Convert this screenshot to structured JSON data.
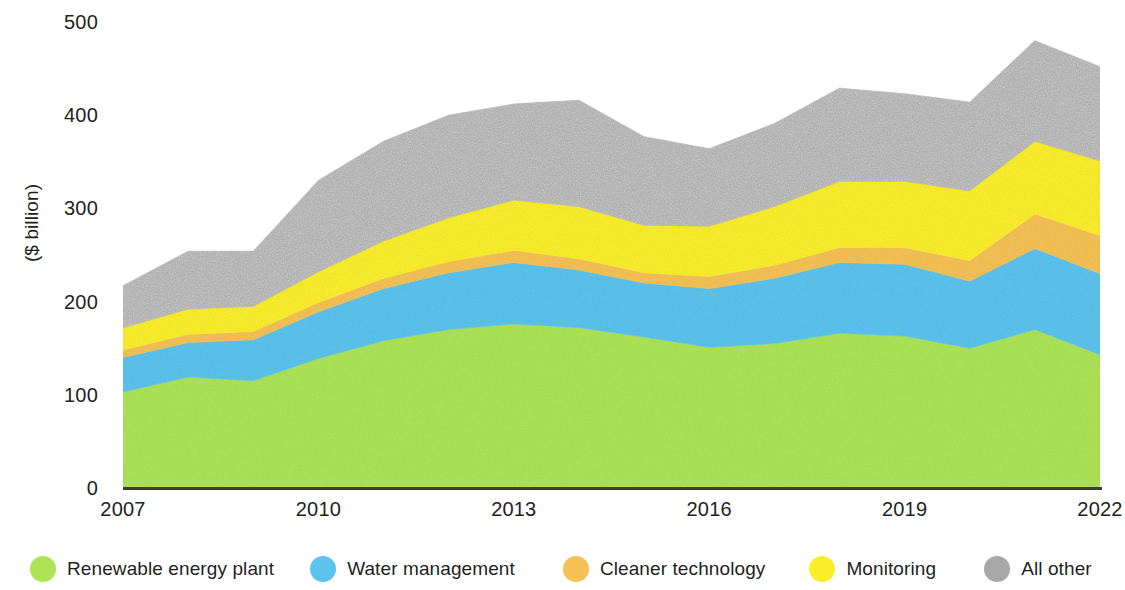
{
  "chart_data": {
    "type": "area",
    "stacked": true,
    "title": "",
    "subtitle": "",
    "xlabel": "",
    "ylabel": "($ billion)",
    "xlim": [
      2007,
      2022
    ],
    "ylim": [
      0,
      500
    ],
    "grid": false,
    "legend_position": "bottom",
    "x": [
      2007,
      2008,
      2009,
      2010,
      2011,
      2012,
      2013,
      2014,
      2015,
      2016,
      2017,
      2018,
      2019,
      2020,
      2021,
      2022
    ],
    "tick_labels": {
      "x": [
        "2007",
        "2010",
        "2013",
        "2016",
        "2019",
        "2022"
      ],
      "y": [
        "0",
        "100",
        "200",
        "300",
        "400",
        "500"
      ]
    },
    "x_tick_values": [
      2007,
      2010,
      2013,
      2016,
      2019,
      2022
    ],
    "y_tick_values": [
      0,
      100,
      200,
      300,
      400,
      500
    ],
    "series": [
      {
        "name": "Renewable energy plant",
        "color": "#ADE456",
        "values": [
          103,
          119,
          115,
          139,
          158,
          170,
          176,
          172,
          162,
          151,
          155,
          166,
          163,
          150,
          170,
          143
        ]
      },
      {
        "name": "Water management",
        "color": "#5BC3EC",
        "values": [
          37,
          37,
          44,
          50,
          56,
          61,
          66,
          62,
          58,
          63,
          70,
          76,
          77,
          72,
          87,
          87
        ]
      },
      {
        "name": "Cleaner technology",
        "color": "#F5C155",
        "values": [
          8,
          9,
          9,
          10,
          11,
          12,
          13,
          12,
          11,
          13,
          14,
          16,
          18,
          22,
          37,
          41
        ]
      },
      {
        "name": "Monitoring",
        "color": "#FAEE2B",
        "values": [
          24,
          27,
          27,
          33,
          40,
          47,
          54,
          56,
          51,
          54,
          63,
          71,
          71,
          75,
          78,
          80
        ]
      },
      {
        "name": "All other",
        "color": "#A8A8A8",
        "values": [
          45,
          62,
          59,
          98,
          107,
          110,
          103,
          114,
          95,
          83,
          89,
          100,
          94,
          95,
          108,
          101
        ]
      }
    ],
    "totals": [
      217,
      254,
      254,
      330,
      372,
      400,
      412,
      416,
      377,
      364,
      391,
      429,
      423,
      414,
      480,
      452
    ]
  },
  "legend": {
    "items": [
      {
        "label": "Renewable energy plant",
        "color": "#ADE456",
        "swatch": "circle-swatch-green"
      },
      {
        "label": "Water management",
        "color": "#5BC3EC",
        "swatch": "circle-swatch-blue"
      },
      {
        "label": "Cleaner technology",
        "color": "#F5C155",
        "swatch": "circle-swatch-orange"
      },
      {
        "label": "Monitoring",
        "color": "#FAEE2B",
        "swatch": "circle-swatch-yellow"
      },
      {
        "label": "All other",
        "color": "#A8A8A8",
        "swatch": "circle-swatch-gray"
      }
    ]
  },
  "axes": {
    "y_title": "($ billion)",
    "y_labels": [
      "500",
      "400",
      "300",
      "200",
      "100",
      "0"
    ],
    "x_labels": [
      "2007",
      "2010",
      "2013",
      "2016",
      "2019",
      "2022"
    ]
  }
}
